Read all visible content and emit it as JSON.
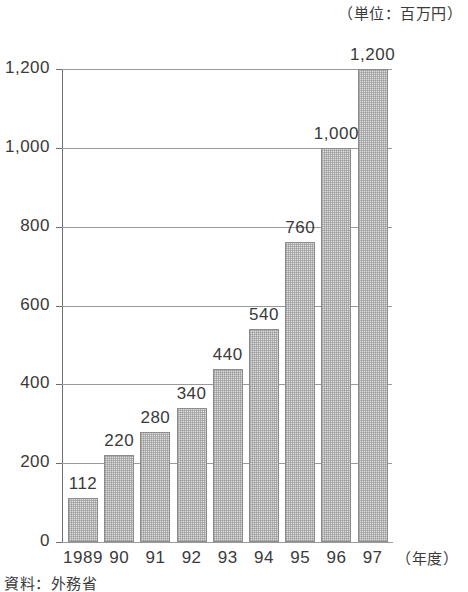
{
  "unit_note": "（単位：百万円）",
  "source_note": "資料：外務省",
  "xaxis_title": "（年度）",
  "chart_data": {
    "type": "bar",
    "title": "",
    "subtitle": "",
    "xlabel": "（年度）",
    "ylabel": "",
    "unit": "百万円",
    "unit_note": "（単位：百万円）",
    "source": "資料：外務省",
    "categories": [
      "1989",
      "90",
      "91",
      "92",
      "93",
      "94",
      "95",
      "96",
      "97"
    ],
    "values": [
      112,
      220,
      280,
      340,
      440,
      540,
      760,
      1000,
      1200
    ],
    "value_labels": [
      "112",
      "220",
      "280",
      "340",
      "440",
      "540",
      "760",
      "1,000",
      "1,200"
    ],
    "ylim": [
      0,
      1200
    ],
    "yticks": [
      0,
      200,
      400,
      600,
      800,
      1000,
      1200
    ],
    "ytick_labels": [
      "0",
      "200",
      "400",
      "600",
      "800",
      "1,000",
      "1,200"
    ],
    "grid": true,
    "legend": "none",
    "bar_fill": "#dcdcdc",
    "bar_border": "#8c8c8c",
    "axis_color": "#6f6f6f",
    "grid_color": "#9a9a9a"
  }
}
